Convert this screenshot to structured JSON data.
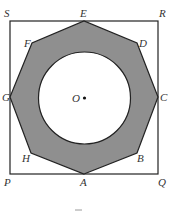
{
  "diagram": {
    "type": "geometry",
    "colors": {
      "background": "#ffffff",
      "stroke": "#222222",
      "shade": "#8f8f8f",
      "circle_fill": "#ffffff",
      "label": "#333333"
    },
    "square": {
      "vertices": [
        "P",
        "Q",
        "R",
        "S"
      ],
      "points": {
        "P": [
          10,
          174
        ],
        "Q": [
          158,
          174
        ],
        "R": [
          158,
          21
        ],
        "S": [
          10,
          21
        ]
      }
    },
    "octagon": {
      "vertices": [
        "A",
        "B",
        "C",
        "D",
        "E",
        "F",
        "G",
        "H"
      ],
      "points": {
        "A": [
          84,
          174
        ],
        "B": [
          137,
          153
        ],
        "C": [
          158,
          97
        ],
        "D": [
          137,
          43
        ],
        "E": [
          84,
          21
        ],
        "F": [
          32,
          43
        ],
        "G": [
          10,
          97
        ],
        "H": [
          31,
          153
        ]
      }
    },
    "circle": {
      "center_label": "O",
      "cx": 84.5,
      "cy": 98,
      "r": 46
    },
    "labels": [
      {
        "text": "S",
        "x": 4,
        "y": 17
      },
      {
        "text": "E",
        "x": 80,
        "y": 17
      },
      {
        "text": "R",
        "x": 159,
        "y": 17
      },
      {
        "text": "F",
        "x": 24,
        "y": 47
      },
      {
        "text": "D",
        "x": 139,
        "y": 47
      },
      {
        "text": "G",
        "x": 2,
        "y": 101
      },
      {
        "text": "O",
        "x": 72,
        "y": 102
      },
      {
        "text": "C",
        "x": 160,
        "y": 101
      },
      {
        "text": "H",
        "x": 22,
        "y": 162
      },
      {
        "text": "B",
        "x": 137,
        "y": 162
      },
      {
        "text": "P",
        "x": 4,
        "y": 186
      },
      {
        "text": "A",
        "x": 80,
        "y": 186
      },
      {
        "text": "Q",
        "x": 158,
        "y": 186
      }
    ]
  }
}
